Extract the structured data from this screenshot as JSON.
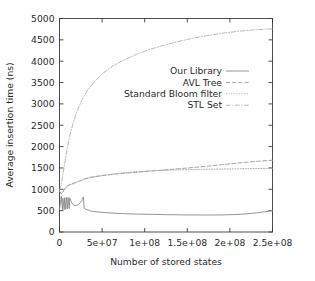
{
  "chart_data": {
    "type": "line",
    "title": "",
    "xlabel": "Number of stored states",
    "ylabel": "Average insertion time (ns)",
    "xlim": [
      0,
      250000000
    ],
    "ylim": [
      0,
      5000
    ],
    "grid": false,
    "legend_position": "inside upper-center-right",
    "xticks": [
      0,
      50000000,
      100000000,
      150000000,
      200000000,
      250000000
    ],
    "xtick_labels": [
      "0",
      "5e+07",
      "1e+08",
      "1.5e+08",
      "2e+08",
      "2.5e+08"
    ],
    "yticks": [
      0,
      500,
      1000,
      1500,
      2000,
      2500,
      3000,
      3500,
      4000,
      4500,
      5000
    ],
    "ytick_labels": [
      "0",
      "500",
      "1000",
      "1500",
      "2000",
      "2500",
      "3000",
      "3500",
      "4000",
      "4500",
      "5000"
    ],
    "series": [
      {
        "name": "Our Library",
        "style": "solid",
        "color": "#8a8a8a",
        "x": [
          0,
          2000000,
          3500000,
          4000000,
          5500000,
          6000000,
          7500000,
          8000000,
          9500000,
          10000000,
          11500000,
          12000000,
          14000000,
          16000000,
          18000000,
          20000000,
          22000000,
          24000000,
          26000000,
          27000000,
          28000000,
          29000000,
          30000000,
          35000000,
          40000000,
          50000000,
          60000000,
          75000000,
          90000000,
          110000000,
          130000000,
          150000000,
          170000000,
          190000000,
          205000000,
          220000000,
          232000000,
          240000000,
          246000000,
          250000000
        ],
        "y": [
          520,
          830,
          520,
          790,
          520,
          800,
          530,
          810,
          540,
          810,
          550,
          800,
          700,
          640,
          620,
          620,
          640,
          680,
          730,
          790,
          820,
          560,
          540,
          500,
          480,
          460,
          445,
          430,
          420,
          412,
          405,
          400,
          398,
          400,
          408,
          425,
          450,
          470,
          490,
          500
        ]
      },
      {
        "name": "AVL Tree",
        "style": "dashed-fine",
        "color": "#9a9a9a",
        "x": [
          0,
          2000000,
          4000000,
          6000000,
          8000000,
          10000000,
          13000000,
          16000000,
          20000000,
          25000000,
          30000000,
          35000000,
          42000000,
          50000000,
          60000000,
          70000000,
          85000000,
          100000000,
          115000000,
          130000000,
          145000000,
          160000000,
          175000000,
          190000000,
          205000000,
          220000000,
          235000000,
          250000000
        ],
        "y": [
          960,
          900,
          940,
          1010,
          1060,
          1090,
          1120,
          1140,
          1170,
          1210,
          1250,
          1275,
          1300,
          1320,
          1345,
          1365,
          1390,
          1415,
          1440,
          1465,
          1490,
          1515,
          1545,
          1575,
          1605,
          1635,
          1660,
          1680
        ]
      },
      {
        "name": "Standard Bloom filter",
        "style": "dotted",
        "color": "#a5a5a5",
        "x": [
          0,
          2000000,
          4000000,
          6000000,
          8000000,
          10000000,
          13000000,
          16000000,
          20000000,
          25000000,
          30000000,
          38000000,
          48000000,
          60000000,
          75000000,
          90000000,
          110000000,
          130000000,
          150000000,
          170000000,
          190000000,
          210000000,
          230000000,
          250000000
        ],
        "y": [
          950,
          900,
          930,
          1000,
          1050,
          1080,
          1110,
          1130,
          1160,
          1200,
          1240,
          1280,
          1315,
          1350,
          1385,
          1410,
          1435,
          1450,
          1460,
          1468,
          1474,
          1480,
          1486,
          1490
        ]
      },
      {
        "name": "STL Set",
        "style": "dash-dot",
        "color": "#b0b0b0",
        "x": [
          0,
          2000000,
          4000000,
          6000000,
          9000000,
          12000000,
          16000000,
          20000000,
          26000000,
          32000000,
          40000000,
          50000000,
          62000000,
          75000000,
          90000000,
          105000000,
          120000000,
          135000000,
          150000000,
          165000000,
          180000000,
          195000000,
          210000000,
          225000000,
          240000000,
          250000000
        ],
        "y": [
          980,
          1100,
          1350,
          1600,
          1950,
          2250,
          2550,
          2800,
          3080,
          3290,
          3500,
          3700,
          3880,
          4020,
          4160,
          4270,
          4360,
          4440,
          4510,
          4570,
          4620,
          4665,
          4700,
          4730,
          4748,
          4760
        ]
      }
    ]
  },
  "legend": {
    "entries": [
      {
        "label": "Our Library"
      },
      {
        "label": "AVL Tree"
      },
      {
        "label": "Standard Bloom filter"
      },
      {
        "label": "STL Set"
      }
    ]
  }
}
